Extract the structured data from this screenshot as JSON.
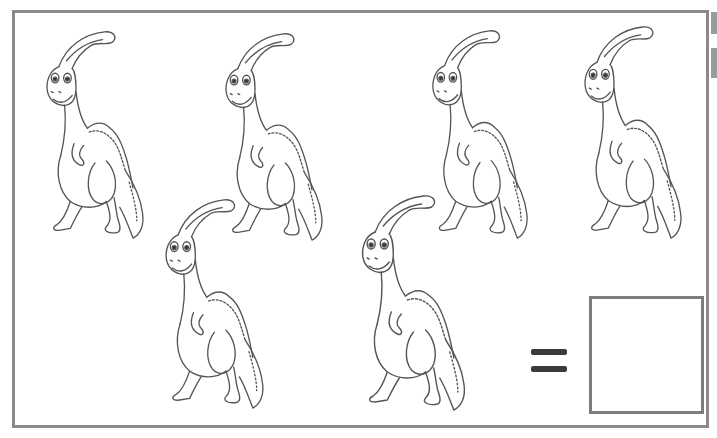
{
  "worksheet": {
    "type": "counting-exercise",
    "subject": "parasaurolophus dinosaur",
    "item_count_shown": 6,
    "equals_symbol": "=",
    "answer_box_value": "",
    "colors": {
      "frame": "#8a8a8a",
      "line_art": "#555555",
      "equals": "#3a3a3a",
      "answer_box_border": "#7d7d7d",
      "background": "#ffffff"
    }
  },
  "dinosaurs": [
    {
      "id": 1,
      "x": 38,
      "y": 28,
      "w": 114,
      "h": 212
    },
    {
      "id": 2,
      "x": 217,
      "y": 30,
      "w": 114,
      "h": 212
    },
    {
      "id": 3,
      "x": 424,
      "y": 27,
      "w": 112,
      "h": 213
    },
    {
      "id": 4,
      "x": 576,
      "y": 23,
      "w": 114,
      "h": 217
    },
    {
      "id": 5,
      "x": 157,
      "y": 196,
      "w": 115,
      "h": 214
    },
    {
      "id": 6,
      "x": 353,
      "y": 192,
      "w": 121,
      "h": 220
    }
  ]
}
